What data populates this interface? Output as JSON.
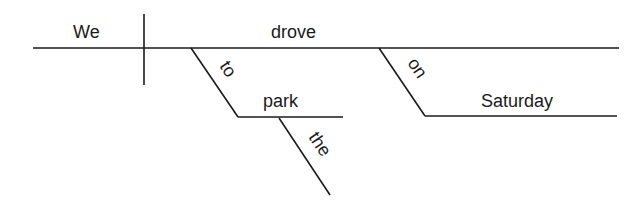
{
  "diagram": {
    "type": "Reed-Kellogg sentence diagram",
    "sentence_words": {
      "subject": "We",
      "verb": "drove",
      "preposition_1": "to",
      "object_1": "park",
      "article_1": "the",
      "preposition_2": "on",
      "object_2": "Saturday"
    }
  }
}
